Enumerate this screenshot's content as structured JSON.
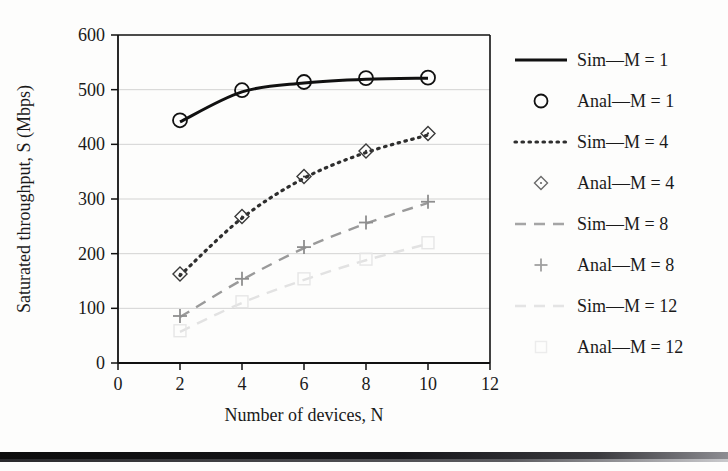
{
  "chart_data": {
    "type": "line",
    "title": "",
    "xlabel": "Number of devices, N",
    "ylabel": "Saturated throughput, S (Mbps)",
    "xlim": [
      0,
      12
    ],
    "ylim": [
      0,
      600
    ],
    "xticks": [
      0,
      2,
      4,
      6,
      8,
      10,
      12
    ],
    "yticks": [
      0,
      100,
      200,
      300,
      400,
      500,
      600
    ],
    "grid": "horizontal",
    "legend_position": "right",
    "x": [
      2,
      4,
      6,
      8,
      10
    ],
    "series": [
      {
        "name": "Sim—M = 1",
        "style": "solid",
        "marker": "none",
        "color": "#111111",
        "values": [
          441,
          496,
          512,
          519,
          521
        ]
      },
      {
        "name": "Anal—M = 1",
        "style": "none",
        "marker": "circle",
        "color": "#111111",
        "values": [
          444,
          499,
          514,
          521,
          522
        ]
      },
      {
        "name": "Sim—M = 4",
        "style": "dotted",
        "marker": "none",
        "color": "#2e2e2e",
        "values": [
          160,
          265,
          338,
          385,
          417
        ]
      },
      {
        "name": "Anal—M = 4",
        "style": "none",
        "marker": "diamond",
        "color": "#3a3a3a",
        "values": [
          163,
          268,
          341,
          388,
          420
        ]
      },
      {
        "name": "Sim—M = 8",
        "style": "dashed",
        "marker": "none",
        "color": "#9a9a9a",
        "values": [
          84,
          152,
          210,
          255,
          293
        ]
      },
      {
        "name": "Anal—M = 8",
        "style": "none",
        "marker": "plus",
        "color": "#8e8e8e",
        "values": [
          86,
          154,
          212,
          257,
          295
        ]
      },
      {
        "name": "Sim—M = 12",
        "style": "dashed",
        "marker": "none",
        "color": "#e2e2e2",
        "values": [
          57,
          110,
          152,
          188,
          218
        ]
      },
      {
        "name": "Anal—M = 12",
        "style": "none",
        "marker": "square",
        "color": "#e6e6e6",
        "values": [
          59,
          112,
          154,
          190,
          220
        ]
      }
    ]
  },
  "legend": {
    "entries": [
      {
        "label": "Sim—M = 1",
        "kind": "line",
        "style": "solid",
        "color": "#111111"
      },
      {
        "label": "Anal—M = 1",
        "kind": "marker",
        "style": "circle",
        "color": "#111111"
      },
      {
        "label": "Sim—M = 4",
        "kind": "line",
        "style": "dotted",
        "color": "#2e2e2e"
      },
      {
        "label": "Anal—M = 4",
        "kind": "marker",
        "style": "diamond",
        "color": "#6a6a6a"
      },
      {
        "label": "Sim—M = 8",
        "kind": "line",
        "style": "dashed",
        "color": "#a5a5a5"
      },
      {
        "label": "Anal—M = 8",
        "kind": "marker",
        "style": "plus",
        "color": "#a0a0a0"
      },
      {
        "label": "Sim—M = 12",
        "kind": "line",
        "style": "dashed",
        "color": "#e4e4e4"
      },
      {
        "label": "Anal—M = 12",
        "kind": "marker",
        "style": "square",
        "color": "#ececec"
      }
    ]
  },
  "axes": {
    "x_tick_labels": [
      "0",
      "2",
      "4",
      "6",
      "8",
      "10",
      "12"
    ],
    "y_tick_labels": [
      "0",
      "100",
      "200",
      "300",
      "400",
      "500",
      "600"
    ],
    "x_title": "Number of devices, N",
    "y_title": "Saturated throughput, S (Mbps)"
  }
}
